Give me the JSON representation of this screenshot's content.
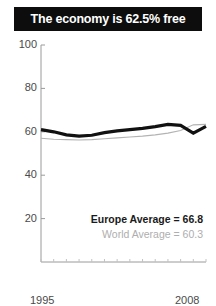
{
  "title": {
    "text": "The economy is 62.5% free",
    "background": "#0d0d0d",
    "color": "#ffffff"
  },
  "legend": {
    "europe": "Europe Average = 66.8",
    "world": "World Average = 60.3"
  },
  "axis": {
    "y_labels": [
      "100",
      "80",
      "60",
      "40",
      "20"
    ],
    "x_start": "1995",
    "x_end": "2008"
  },
  "chart_data": {
    "type": "line",
    "title": "The economy is 62.5% free",
    "xlabel": "",
    "ylabel": "",
    "xlim": [
      1995,
      2008
    ],
    "ylim": [
      0,
      100
    ],
    "yticks": [
      20,
      40,
      60,
      80,
      100
    ],
    "xticks": [
      1995,
      1996,
      1997,
      1998,
      1999,
      2000,
      2001,
      2002,
      2003,
      2004,
      2005,
      2006,
      2007,
      2008
    ],
    "xtick_labels_shown": [
      "1995",
      "2008"
    ],
    "grid": false,
    "legend_position": "inside-bottom-right",
    "x": [
      1995,
      1996,
      1997,
      1998,
      1999,
      2000,
      2001,
      2002,
      2003,
      2004,
      2005,
      2006,
      2007,
      2008
    ],
    "series": [
      {
        "name": "Europe Average",
        "average": 66.8,
        "color": "#111111",
        "width": 3.2,
        "values": [
          61.0,
          60.0,
          58.6,
          58.0,
          58.4,
          59.6,
          60.4,
          61.0,
          61.6,
          62.4,
          63.4,
          63.0,
          59.4,
          62.5
        ]
      },
      {
        "name": "World Average",
        "average": 60.3,
        "color": "#b3b3b3",
        "width": 1.1,
        "values": [
          57.0,
          56.6,
          56.4,
          56.2,
          56.4,
          56.8,
          57.2,
          57.6,
          58.0,
          58.6,
          59.4,
          60.6,
          63.2,
          63.4
        ]
      }
    ]
  }
}
